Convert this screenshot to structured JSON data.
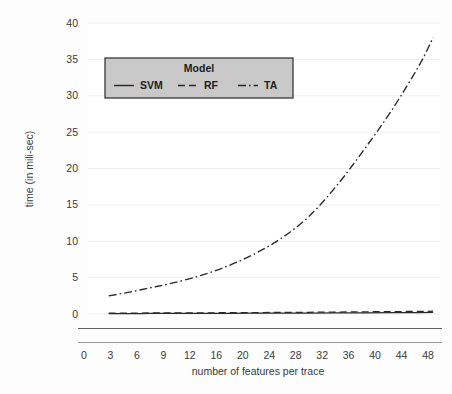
{
  "figure": {
    "background_color": "#fdfdfd",
    "plot_background_color": "#ffffff"
  },
  "chart_data": {
    "type": "line",
    "title": "",
    "xlabel": "number of features per trace",
    "ylabel": "time (in mili-sec)",
    "xlim": [
      0,
      51
    ],
    "ylim": [
      -2.2,
      40
    ],
    "grid": true,
    "grid_axis": "y",
    "legend": {
      "title": "Model",
      "position": "upper-left-inside",
      "facecolor": "#c9c9c9",
      "edgecolor": "#2a2a2a",
      "entries": [
        {
          "label": "SVM",
          "linestyle": "solid",
          "color": "#2a2a2a"
        },
        {
          "label": "RF",
          "linestyle": "dashed",
          "color": "#2a2a2a"
        },
        {
          "label": "TA",
          "linestyle": "dashdot",
          "color": "#2a2a2a"
        }
      ]
    },
    "xticks": [
      0,
      3,
      6,
      9,
      12,
      16,
      20,
      24,
      28,
      32,
      36,
      40,
      44,
      48
    ],
    "xticklabels": [
      "0",
      "3",
      "6",
      "9",
      "12",
      "16",
      "20",
      "24",
      "28",
      "32",
      "36",
      "40",
      "44",
      "48"
    ],
    "yticks": [
      0,
      5,
      10,
      15,
      20,
      25,
      30,
      35,
      40
    ],
    "yticklabels": [
      "0",
      "5",
      "10",
      "15",
      "20",
      "25",
      "30",
      "35",
      "40"
    ],
    "x": [
      3,
      6,
      9,
      12,
      16,
      20,
      24,
      28,
      32,
      36,
      40,
      44,
      48,
      50
    ],
    "series": [
      {
        "name": "SVM",
        "linestyle": "solid",
        "color": "#2a2a2a",
        "values": [
          0.05,
          0.06,
          0.07,
          0.08,
          0.09,
          0.1,
          0.11,
          0.12,
          0.13,
          0.15,
          0.16,
          0.18,
          0.2,
          0.21
        ]
      },
      {
        "name": "RF",
        "linestyle": "dashed",
        "color": "#2a2a2a",
        "values": [
          0.12,
          0.13,
          0.14,
          0.15,
          0.16,
          0.18,
          0.2,
          0.22,
          0.24,
          0.27,
          0.3,
          0.33,
          0.36,
          0.38
        ]
      },
      {
        "name": "TA",
        "linestyle": "dashdot",
        "color": "#2a2a2a",
        "values": [
          2.5,
          3.0,
          3.6,
          4.2,
          5.2,
          6.5,
          8.2,
          10.4,
          13.4,
          17.6,
          22.6,
          28.0,
          34.2,
          38.0
        ]
      }
    ],
    "baseline_rule_y": -2.0
  },
  "axis": {
    "y_title": "time (in mili-sec)",
    "x_title": "number of features per trace"
  }
}
